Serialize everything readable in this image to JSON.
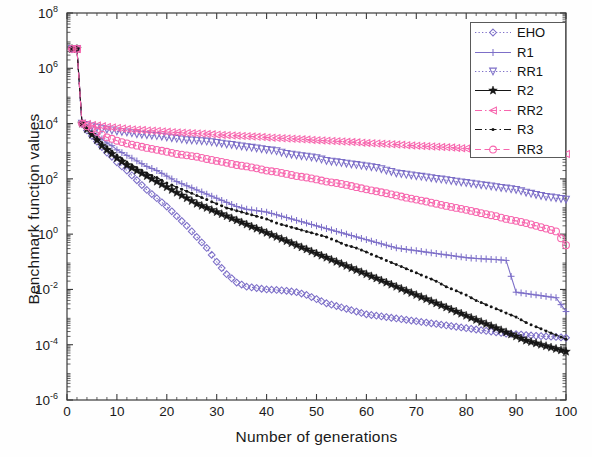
{
  "chart_data": {
    "type": "line",
    "title": "",
    "xlabel": "Number of generations",
    "ylabel": "Benchmark function values",
    "xlim": [
      0,
      100
    ],
    "ylim_log10": [
      -6,
      8
    ],
    "yscale": "log",
    "grid": false,
    "legend_position": "upper-right",
    "xticks": [
      "0",
      "10",
      "20",
      "30",
      "40",
      "50",
      "60",
      "70",
      "80",
      "90",
      "100"
    ],
    "xtick_values": [
      0,
      10,
      20,
      30,
      40,
      50,
      60,
      70,
      80,
      90,
      100
    ],
    "yticks": [
      "10-6",
      "10-4",
      "10-2",
      "100",
      "102",
      "104",
      "106",
      "108"
    ],
    "ytick_exponents": [
      -6,
      -4,
      -2,
      0,
      2,
      4,
      6,
      8
    ],
    "ytick_base": "10",
    "x": [
      1,
      2,
      3,
      4,
      5,
      6,
      7,
      8,
      9,
      10,
      12,
      14,
      16,
      18,
      20,
      22,
      24,
      26,
      28,
      30,
      32,
      34,
      36,
      38,
      40,
      42,
      44,
      46,
      48,
      50,
      52,
      54,
      56,
      58,
      60,
      62,
      64,
      66,
      68,
      70,
      72,
      74,
      76,
      78,
      80,
      82,
      84,
      86,
      88,
      90,
      92,
      94,
      96,
      98,
      100
    ],
    "series": [
      {
        "name": "EHO",
        "color": "#7d6fc8",
        "marker": "diamond",
        "linestyle": "dotted",
        "log10_values": [
          6.7,
          6.7,
          4.0,
          3.75,
          3.55,
          3.35,
          3.15,
          2.95,
          2.8,
          2.6,
          2.3,
          1.95,
          1.6,
          1.3,
          1.0,
          0.65,
          0.3,
          -0.1,
          -0.5,
          -1.0,
          -1.45,
          -1.75,
          -1.9,
          -1.95,
          -2.0,
          -2.02,
          -2.05,
          -2.1,
          -2.2,
          -2.35,
          -2.5,
          -2.6,
          -2.7,
          -2.8,
          -2.9,
          -2.95,
          -3.0,
          -3.05,
          -3.1,
          -3.15,
          -3.2,
          -3.25,
          -3.3,
          -3.35,
          -3.4,
          -3.45,
          -3.5,
          -3.55,
          -3.6,
          -3.62,
          -3.65,
          -3.68,
          -3.7,
          -3.72,
          -3.75
        ]
      },
      {
        "name": "R1",
        "color": "#7d6fc8",
        "marker": "plus",
        "linestyle": "solid",
        "log10_values": [
          6.7,
          6.7,
          4.0,
          3.85,
          3.7,
          3.6,
          3.45,
          3.3,
          3.2,
          3.05,
          2.85,
          2.65,
          2.45,
          2.3,
          2.1,
          1.9,
          1.75,
          1.6,
          1.45,
          1.3,
          1.15,
          1.0,
          0.9,
          0.85,
          0.8,
          0.7,
          0.6,
          0.5,
          0.4,
          0.3,
          0.2,
          0.1,
          0.0,
          -0.1,
          -0.2,
          -0.3,
          -0.4,
          -0.5,
          -0.55,
          -0.6,
          -0.65,
          -0.7,
          -0.75,
          -0.8,
          -0.85,
          -0.88,
          -0.9,
          -0.92,
          -0.95,
          -2.1,
          -2.15,
          -2.2,
          -2.25,
          -2.3,
          -2.8
        ]
      },
      {
        "name": "RR1",
        "color": "#7d6fc8",
        "marker": "triangle-down",
        "linestyle": "dotted",
        "log10_values": [
          6.7,
          6.7,
          4.0,
          3.95,
          3.9,
          3.85,
          3.8,
          3.78,
          3.75,
          3.72,
          3.68,
          3.62,
          3.58,
          3.55,
          3.5,
          3.45,
          3.4,
          3.38,
          3.35,
          3.3,
          3.25,
          3.2,
          3.15,
          3.1,
          3.05,
          3.0,
          2.9,
          2.85,
          2.8,
          2.75,
          2.65,
          2.6,
          2.55,
          2.5,
          2.45,
          2.4,
          2.3,
          2.2,
          2.15,
          2.1,
          2.05,
          2.0,
          1.95,
          1.9,
          1.85,
          1.8,
          1.75,
          1.7,
          1.65,
          1.6,
          1.5,
          1.42,
          1.35,
          1.3,
          1.25
        ]
      },
      {
        "name": "R2",
        "color": "#161616",
        "marker": "star",
        "linestyle": "solid",
        "log10_values": [
          6.7,
          6.7,
          4.0,
          3.8,
          3.6,
          3.4,
          3.2,
          3.05,
          2.9,
          2.75,
          2.5,
          2.3,
          2.1,
          1.9,
          1.7,
          1.5,
          1.3,
          1.1,
          0.95,
          0.8,
          0.65,
          0.5,
          0.35,
          0.2,
          0.05,
          -0.1,
          -0.25,
          -0.4,
          -0.55,
          -0.7,
          -0.85,
          -1.0,
          -1.15,
          -1.3,
          -1.45,
          -1.6,
          -1.75,
          -1.9,
          -2.05,
          -2.2,
          -2.35,
          -2.5,
          -2.65,
          -2.8,
          -2.95,
          -3.1,
          -3.25,
          -3.4,
          -3.55,
          -3.7,
          -3.85,
          -3.95,
          -4.05,
          -4.15,
          -4.25
        ]
      },
      {
        "name": "RR2",
        "color": "#f766ae",
        "marker": "triangle-left",
        "linestyle": "dashdot",
        "log10_values": [
          6.7,
          6.7,
          4.0,
          3.98,
          3.95,
          3.93,
          3.9,
          3.88,
          3.86,
          3.84,
          3.8,
          3.78,
          3.75,
          3.73,
          3.7,
          3.68,
          3.66,
          3.64,
          3.62,
          3.6,
          3.58,
          3.56,
          3.54,
          3.52,
          3.5,
          3.48,
          3.46,
          3.44,
          3.42,
          3.4,
          3.38,
          3.36,
          3.34,
          3.32,
          3.3,
          3.28,
          3.26,
          3.24,
          3.22,
          3.2,
          3.18,
          3.16,
          3.14,
          3.12,
          3.1,
          3.08,
          3.06,
          3.04,
          3.02,
          3.0,
          2.98,
          2.96,
          2.94,
          2.92,
          2.9
        ]
      },
      {
        "name": "R3",
        "color": "#161616",
        "marker": "dot",
        "linestyle": "dashdot",
        "log10_values": [
          6.7,
          6.7,
          4.0,
          3.82,
          3.65,
          3.5,
          3.3,
          3.15,
          3.0,
          2.85,
          2.6,
          2.4,
          2.2,
          2.05,
          1.85,
          1.7,
          1.55,
          1.4,
          1.25,
          1.1,
          0.95,
          0.85,
          0.75,
          0.65,
          0.55,
          0.4,
          0.3,
          0.2,
          0.1,
          0.0,
          -0.1,
          -0.25,
          -0.4,
          -0.5,
          -0.65,
          -0.8,
          -0.95,
          -1.1,
          -1.25,
          -1.4,
          -1.55,
          -1.7,
          -1.9,
          -2.05,
          -2.2,
          -2.4,
          -2.55,
          -2.7,
          -2.85,
          -3.0,
          -3.2,
          -3.35,
          -3.5,
          -3.65,
          -3.8
        ]
      },
      {
        "name": "RR3",
        "color": "#f766ae",
        "marker": "circle",
        "linestyle": "dashed",
        "log10_values": [
          6.7,
          6.7,
          4.0,
          3.9,
          3.8,
          3.7,
          3.6,
          3.5,
          3.45,
          3.38,
          3.28,
          3.2,
          3.12,
          3.05,
          2.98,
          2.9,
          2.85,
          2.8,
          2.72,
          2.65,
          2.58,
          2.5,
          2.45,
          2.38,
          2.3,
          2.25,
          2.18,
          2.1,
          2.05,
          1.98,
          1.9,
          1.85,
          1.78,
          1.7,
          1.62,
          1.55,
          1.48,
          1.4,
          1.32,
          1.25,
          1.18,
          1.1,
          1.02,
          0.95,
          0.88,
          0.8,
          0.72,
          0.65,
          0.55,
          0.48,
          0.4,
          0.3,
          0.2,
          0.1,
          -0.4
        ]
      }
    ]
  },
  "legend": {
    "items": [
      {
        "label": "EHO"
      },
      {
        "label": "R1"
      },
      {
        "label": "RR1"
      },
      {
        "label": "R2"
      },
      {
        "label": "RR2"
      },
      {
        "label": "R3"
      },
      {
        "label": "RR3"
      }
    ]
  },
  "colors": {
    "blue_purple": "#7d6fc8",
    "pink": "#f766ae",
    "black": "#161616",
    "axis": "#3a3a3a",
    "background": "#fefefe"
  }
}
